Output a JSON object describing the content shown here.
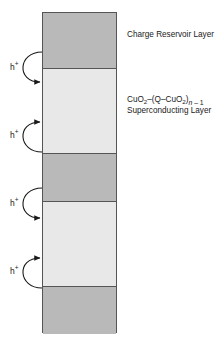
{
  "figure": {
    "background_color": "#ffffff",
    "stroke_color": "#555555"
  },
  "stack": {
    "left": 42,
    "top": 12,
    "width": 75,
    "height": 321,
    "colors": {
      "charge_reservoir": "#b9b9b9",
      "superconducting": "#e8e8e8",
      "outline": "#555555"
    },
    "bands": [
      {
        "type": "charge-reservoir",
        "top": 0,
        "height": 55,
        "shade": "dark"
      },
      {
        "type": "superconducting",
        "top": 55,
        "height": 85,
        "shade": "light"
      },
      {
        "type": "charge-reservoir",
        "top": 140,
        "height": 48,
        "shade": "dark"
      },
      {
        "type": "superconducting",
        "top": 188,
        "height": 85,
        "shade": "light"
      },
      {
        "type": "charge-reservoir",
        "top": 273,
        "height": 48,
        "shade": "dark"
      }
    ],
    "dividers": [
      55,
      140,
      188,
      273
    ]
  },
  "holes": [
    {
      "label": "h",
      "charge": "+",
      "direction": "down",
      "x": 10,
      "y": 63
    },
    {
      "label": "h",
      "charge": "+",
      "direction": "up",
      "x": 10,
      "y": 131
    },
    {
      "label": "h",
      "charge": "+",
      "direction": "down",
      "x": 10,
      "y": 199
    },
    {
      "label": "h",
      "charge": "+",
      "direction": "up",
      "x": 10,
      "y": 267
    }
  ],
  "labels": {
    "charge_reservoir": "Charge Reservoir Layer",
    "superconducting_formula": {
      "part1": "CuO",
      "sub1": "2",
      "part2": "–(Q–CuO",
      "sub2": "2",
      "part3": ")",
      "sub3_italic": "n",
      "sub3_rest": " – 1"
    },
    "superconducting_line2": "Superconducting Layer"
  }
}
